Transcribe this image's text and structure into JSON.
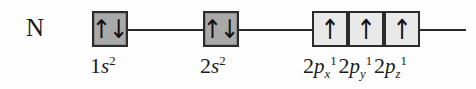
{
  "diagram": {
    "element_symbol": "N",
    "colors": {
      "background": "#fdfdfd",
      "line": "#2a2a2a",
      "box_border": "#2b2b2b",
      "s_box_fill": "#a9a9a9",
      "p_box_fill": "#e9e9e9",
      "text": "#1a1a1a"
    },
    "arrow_glyphs": {
      "up": "↑",
      "down": "↓"
    },
    "orbitals": [
      {
        "id": "1s",
        "shell": "1",
        "subshell": "s",
        "electrons": 2,
        "spins": [
          "up",
          "down"
        ],
        "fill_style": "s",
        "label_main": "1",
        "label_orbital": "s",
        "label_superscript": "2",
        "label_text": "1s2"
      },
      {
        "id": "2s",
        "shell": "2",
        "subshell": "s",
        "electrons": 2,
        "spins": [
          "up",
          "down"
        ],
        "fill_style": "s",
        "label_main": "2",
        "label_orbital": "s",
        "label_superscript": "2",
        "label_text": "2s2"
      },
      {
        "id": "2px",
        "shell": "2",
        "subshell": "p",
        "axis": "x",
        "electrons": 1,
        "spins": [
          "up"
        ],
        "fill_style": "p",
        "label_main": "2",
        "label_orbital": "p",
        "label_subscript": "x",
        "label_superscript": "1",
        "label_text": "2px1"
      },
      {
        "id": "2py",
        "shell": "2",
        "subshell": "p",
        "axis": "y",
        "electrons": 1,
        "spins": [
          "up"
        ],
        "fill_style": "p",
        "label_main": "2",
        "label_orbital": "p",
        "label_subscript": "y",
        "label_superscript": "1",
        "label_text": "2py1"
      },
      {
        "id": "2pz",
        "shell": "2",
        "subshell": "p",
        "axis": "z",
        "electrons": 1,
        "spins": [
          "up"
        ],
        "fill_style": "p",
        "label_main": "2",
        "label_orbital": "p",
        "label_subscript": "z",
        "label_superscript": "1",
        "label_text": "2pz1"
      }
    ]
  }
}
